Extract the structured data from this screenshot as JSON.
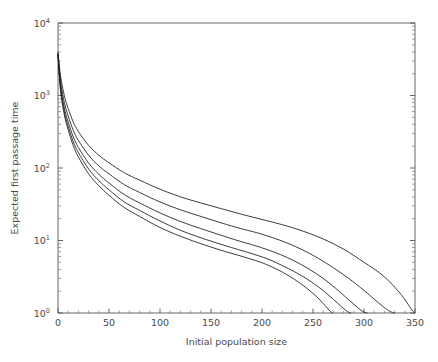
{
  "chart_data": {
    "type": "line",
    "title": "",
    "xlabel": "Initial population size",
    "ylabel": "Expected first passage time",
    "xlim": [
      0,
      350
    ],
    "ylim": [
      1,
      10000
    ],
    "yscale": "log",
    "xscale": "linear",
    "grid": false,
    "legend": null,
    "xticks": [
      0,
      50,
      100,
      150,
      200,
      250,
      300,
      350
    ],
    "xticklabels": [
      "0",
      "50",
      "100",
      "150",
      "200",
      "250",
      "300",
      "350"
    ],
    "yticks": [
      1,
      10,
      100,
      1000,
      10000
    ],
    "yticklabels": [
      "10^0",
      "10^1",
      "10^2",
      "10^3",
      "10^4"
    ],
    "ytick_mantissas": [
      "10",
      "10",
      "10",
      "10",
      "10"
    ],
    "ytick_exponents": [
      "0",
      "1",
      "2",
      "3",
      "4"
    ],
    "line_color": "#1a1a1a",
    "axis_color": "#555555",
    "background": "#ffffff",
    "series": [
      {
        "name": "curve-1",
        "x": [
          0,
          2,
          4,
          7,
          10,
          15,
          20,
          30,
          40,
          50,
          65,
          80,
          100,
          120,
          140,
          160,
          180,
          200,
          220,
          240,
          260,
          280,
          300,
          315,
          325,
          335,
          342,
          347,
          350
        ],
        "y": [
          3900,
          2100,
          1400,
          900,
          660,
          430,
          320,
          205,
          150,
          118,
          86,
          68,
          51,
          40,
          33,
          27.5,
          23,
          19.5,
          16.5,
          13.5,
          10.5,
          7.6,
          5.0,
          3.6,
          2.7,
          1.9,
          1.4,
          1.1,
          1.0
        ]
      },
      {
        "name": "curve-2",
        "x": [
          0,
          2,
          4,
          7,
          10,
          15,
          20,
          30,
          40,
          50,
          65,
          80,
          100,
          120,
          140,
          160,
          180,
          195,
          210,
          225,
          240,
          255,
          270,
          285,
          300,
          310,
          318,
          324,
          328,
          330
        ],
        "y": [
          3800,
          1800,
          1150,
          720,
          520,
          330,
          240,
          150,
          107,
          83,
          59,
          46,
          34,
          26.5,
          21.5,
          17.5,
          14.5,
          12.8,
          11.0,
          9.2,
          7.4,
          5.7,
          4.2,
          3.0,
          2.05,
          1.55,
          1.25,
          1.08,
          1.02,
          1.0
        ]
      },
      {
        "name": "curve-3",
        "x": [
          0,
          2,
          4,
          7,
          10,
          15,
          20,
          30,
          40,
          50,
          65,
          80,
          100,
          120,
          140,
          160,
          178,
          192,
          205,
          218,
          232,
          246,
          260,
          272,
          282,
          290,
          296,
          300,
          303
        ],
        "y": [
          3700,
          1600,
          980,
          600,
          430,
          268,
          192,
          117,
          82,
          62,
          43,
          33,
          24,
          18.3,
          14.6,
          11.8,
          9.8,
          8.6,
          7.5,
          6.4,
          5.2,
          4.05,
          3.0,
          2.2,
          1.66,
          1.32,
          1.12,
          1.03,
          1.0
        ]
      },
      {
        "name": "curve-4",
        "x": [
          0,
          2,
          4,
          7,
          10,
          15,
          20,
          30,
          40,
          50,
          65,
          80,
          100,
          118,
          136,
          154,
          170,
          184,
          196,
          208,
          220,
          232,
          244,
          256,
          266,
          274,
          280,
          284,
          287
        ],
        "y": [
          3650,
          1480,
          880,
          530,
          375,
          230,
          163,
          97,
          67,
          50,
          34,
          26,
          18.6,
          14.2,
          11.4,
          9.4,
          8.0,
          7.0,
          6.2,
          5.4,
          4.5,
          3.7,
          2.95,
          2.25,
          1.73,
          1.37,
          1.15,
          1.04,
          1.0
        ]
      },
      {
        "name": "curve-5",
        "x": [
          0,
          2,
          4,
          7,
          10,
          15,
          20,
          30,
          40,
          50,
          65,
          80,
          98,
          115,
          132,
          148,
          163,
          176,
          188,
          199,
          210,
          221,
          232,
          243,
          252,
          259,
          264,
          267,
          269
        ],
        "y": [
          3600,
          1380,
          810,
          480,
          335,
          203,
          142,
          83,
          57,
          42,
          28.5,
          21.5,
          15.6,
          12.2,
          9.9,
          8.3,
          7.1,
          6.3,
          5.6,
          5.0,
          4.3,
          3.6,
          2.9,
          2.25,
          1.76,
          1.4,
          1.17,
          1.05,
          1.0
        ]
      }
    ]
  },
  "plot_geometry": {
    "left": 58,
    "top": 23,
    "right": 415,
    "bottom": 313
  }
}
